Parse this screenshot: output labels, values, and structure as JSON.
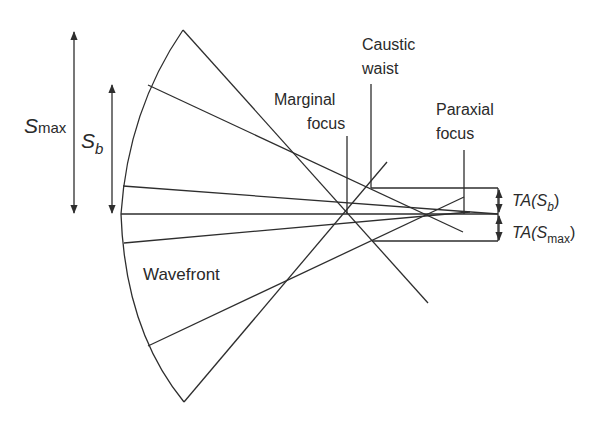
{
  "figure": {
    "top_clipped_text": "...g ... y ... y ... g,",
    "labels": {
      "smax_main": "S",
      "smax_sub": "max",
      "sb_main": "S",
      "sb_sub": "b",
      "caustic_line1": "Caustic",
      "caustic_line2": "waist",
      "marginal_line1": "Marginal",
      "marginal_line2": "focus",
      "paraxial_line1": "Paraxial",
      "paraxial_line2": "focus",
      "wavefront": "Wavefront",
      "ta_sb_prefix": "TA(",
      "ta_sb_main": "S",
      "ta_sb_sub": "b",
      "ta_sb_suffix": ")",
      "ta_smax_prefix": "TA(",
      "ta_smax_main": "S",
      "ta_smax_sub": "max",
      "ta_smax_suffix": ")"
    },
    "colors": {
      "line": "#2e2e2e",
      "text": "#2a2a2a",
      "background": "#ffffff"
    }
  }
}
